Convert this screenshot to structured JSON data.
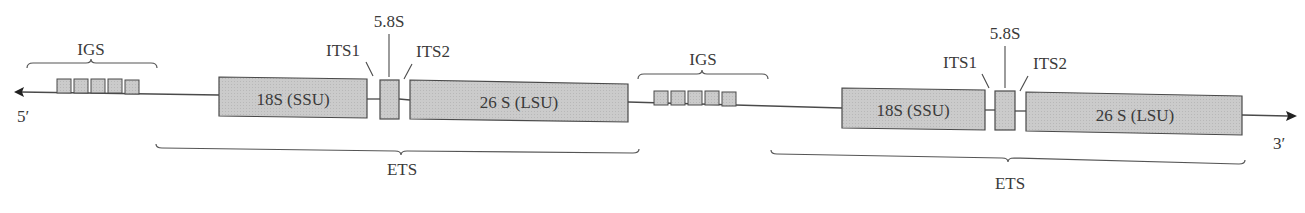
{
  "diagram": {
    "colors": {
      "box_fill": "#c9c9c9",
      "stroke": "#4a4a4a",
      "text": "#3a3a3a"
    },
    "ends": {
      "left": "5′",
      "right": "3′"
    },
    "units": [
      {
        "igs_label": "IGS",
        "ssu_label": "18S (SSU)",
        "its1_label": "ITS1",
        "s58_label": "5.8S",
        "its2_label": "ITS2",
        "lsu_label": "26 S (LSU)",
        "ets_label": "ETS"
      },
      {
        "igs_label": "IGS",
        "ssu_label": "18S (SSU)",
        "its1_label": "ITS1",
        "s58_label": "5.8S",
        "its2_label": "ITS2",
        "lsu_label": "26 S (LSU)",
        "ets_label": "ETS"
      }
    ]
  }
}
